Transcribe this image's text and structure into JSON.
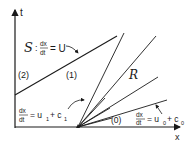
{
  "axes": {
    "t_label": "t",
    "x_label": "x"
  },
  "shock": {
    "symbol": "S",
    "colon": ":",
    "num": "dx",
    "den": "dt",
    "rhs": "= U"
  },
  "regions": {
    "region2": "(2)",
    "region1": "(1)",
    "region0": "(0)",
    "fan": "R"
  },
  "characteristic1": {
    "num": "dx",
    "den": "dt",
    "rhs": "= u",
    "sub1": "1",
    "plus": "+ c",
    "sub2": "1"
  },
  "characteristic0": {
    "num": "dx",
    "den": "dt",
    "rhs": "= u",
    "sub1": "0",
    "plus": "+ c",
    "sub2": "0"
  },
  "colors": {
    "ink": "#1a1a1a",
    "background": "#ffffff"
  }
}
